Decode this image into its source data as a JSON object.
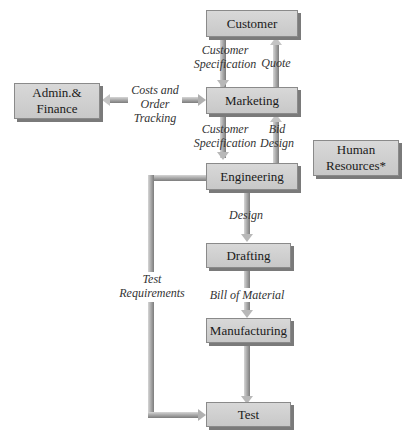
{
  "diagram": {
    "type": "flowchart",
    "nodes": {
      "customer": "Customer",
      "marketing": "Marketing",
      "admin_line1": "Admin.&",
      "admin_line2": "Finance",
      "engineering": "Engineering",
      "hr_line1": "Human",
      "hr_line2": "Resources*",
      "drafting": "Drafting",
      "manufacturing": "Manufacturing",
      "test": "Test"
    },
    "edges": {
      "cust_spec_1_l1": "Customer",
      "cust_spec_1_l2": "Specification",
      "quote": "Quote",
      "costs_l1": "Costs and",
      "costs_l2": "Order",
      "costs_l3": "Tracking",
      "cust_spec_2_l1": "Customer",
      "cust_spec_2_l2": "Specification",
      "bid_l1": "Bid",
      "bid_l2": "Design",
      "design": "Design",
      "test_req_l1": "Test",
      "test_req_l2": "Requirements",
      "bom": "Bill of Material"
    },
    "connections": [
      {
        "from": "Customer",
        "to": "Marketing",
        "label": "Customer Specification"
      },
      {
        "from": "Marketing",
        "to": "Customer",
        "label": "Quote"
      },
      {
        "from": "Marketing",
        "to": "Admin.& Finance",
        "label": "Costs and Order Tracking"
      },
      {
        "from": "Marketing",
        "to": "Engineering",
        "label": "Customer Specification"
      },
      {
        "from": "Engineering",
        "to": "Marketing",
        "label": "Bid Design"
      },
      {
        "from": "Engineering",
        "to": "Drafting",
        "label": "Design"
      },
      {
        "from": "Drafting",
        "to": "Manufacturing",
        "label": "Bill of Material"
      },
      {
        "from": "Manufacturing",
        "to": "Test",
        "label": ""
      },
      {
        "from": "Engineering",
        "to": "Test",
        "label": "Test Requirements"
      }
    ]
  }
}
